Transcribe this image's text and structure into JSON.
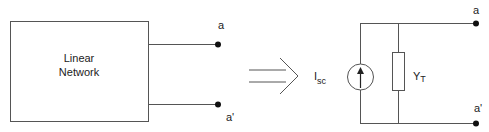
{
  "diagram": {
    "left": {
      "box_label_line1": "Linear",
      "box_label_line2": "Network",
      "terminal_top": "a",
      "terminal_bottom": "a'"
    },
    "arrow": {
      "meaning": "equivalent-to"
    },
    "right": {
      "source_label_main": "I",
      "source_label_sub": "sc",
      "admittance_label_main": "Y",
      "admittance_label_sub": "T",
      "terminal_top": "a",
      "terminal_bottom": "a'"
    },
    "colors": {
      "line": "#555555",
      "text": "#222222",
      "dot": "#111111",
      "background": "#ffffff"
    }
  }
}
